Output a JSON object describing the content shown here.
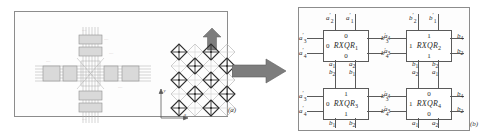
{
  "figure": {
    "panels": [
      {
        "id": "a",
        "caption": "(a)",
        "description": "crossbar-array-schematic-with-lattice"
      },
      {
        "id": "b",
        "caption": "(b)",
        "description": "rxqr-gate-block-diagram"
      }
    ],
    "axis": {
      "x_label": "x",
      "y_label": "y"
    },
    "arrows": [
      {
        "name": "up-arrow",
        "direction": "up"
      },
      {
        "name": "right-arrow",
        "direction": "right"
      }
    ]
  },
  "gates": [
    {
      "name": "RXQR",
      "index": "1",
      "label_prefix": "RXQR",
      "top_value": "0",
      "bottom_value": "0",
      "left_value": "0",
      "right_value": "",
      "top_ports": [
        {
          "base": "a",
          "sub": "2",
          "prime": true
        },
        {
          "base": "a",
          "sub": "1",
          "prime": true
        }
      ],
      "left_ports": [
        {
          "base": "a",
          "sub": "3",
          "prime": true
        },
        {
          "base": "a",
          "sub": "4",
          "prime": true
        }
      ],
      "right_ports": [
        {
          "base": "a",
          "sub": "4",
          "prime": false
        },
        {
          "base": "a",
          "sub": "3",
          "prime": false
        }
      ],
      "bottom_ports": [
        {
          "base": "a",
          "sub": "1",
          "prime": false
        },
        {
          "base": "a",
          "sub": "2",
          "prime": false
        }
      ]
    },
    {
      "name": "RXQR",
      "index": "2",
      "label_prefix": "RXQR",
      "top_value": "1",
      "bottom_value": "1",
      "left_value": "1",
      "right_value": "",
      "top_ports": [
        {
          "base": "b",
          "sub": "2",
          "prime": true
        },
        {
          "base": "b",
          "sub": "1",
          "prime": true
        }
      ],
      "left_ports": [
        {
          "base": "b",
          "sub": "3",
          "prime": true
        },
        {
          "base": "b",
          "sub": "4",
          "prime": true
        }
      ],
      "right_ports": [
        {
          "base": "b",
          "sub": "4",
          "prime": false
        },
        {
          "base": "b",
          "sub": "2",
          "prime": false
        }
      ],
      "bottom_ports": [
        {
          "base": "b",
          "sub": "1",
          "prime": false
        },
        {
          "base": "b",
          "sub": "2",
          "prime": false
        }
      ]
    },
    {
      "name": "RXQR",
      "index": "3",
      "label_prefix": "RXQR",
      "top_value": "1",
      "bottom_value": "1",
      "left_value": "0",
      "right_value": "",
      "top_ports": [
        {
          "base": "b",
          "sub": "2",
          "prime": false
        },
        {
          "base": "b",
          "sub": "1",
          "prime": false
        }
      ],
      "left_ports": [
        {
          "base": "a",
          "sub": "3",
          "prime": true
        },
        {
          "base": "a",
          "sub": "4",
          "prime": true
        }
      ],
      "right_ports": [
        {
          "base": "a",
          "sub": "4",
          "prime": false
        },
        {
          "base": "a",
          "sub": "3",
          "prime": false
        }
      ],
      "bottom_ports": [
        {
          "base": "b",
          "sub": "1",
          "prime": false
        },
        {
          "base": "b",
          "sub": "2",
          "prime": false
        }
      ]
    },
    {
      "name": "RXQR",
      "index": "4",
      "label_prefix": "RXQR",
      "top_value": "0",
      "bottom_value": "0",
      "left_value": "1",
      "right_value": "",
      "top_ports": [
        {
          "base": "a",
          "sub": "2",
          "prime": false
        },
        {
          "base": "a",
          "sub": "1",
          "prime": false
        }
      ],
      "left_ports": [
        {
          "base": "b",
          "sub": "3",
          "prime": true
        },
        {
          "base": "b",
          "sub": "4",
          "prime": true
        }
      ],
      "right_ports": [
        {
          "base": "b",
          "sub": "4",
          "prime": false
        },
        {
          "base": "b",
          "sub": "2",
          "prime": false
        }
      ],
      "bottom_ports": [
        {
          "base": "a",
          "sub": "1",
          "prime": false
        },
        {
          "base": "a",
          "sub": "2",
          "prime": false
        }
      ]
    }
  ],
  "colors": {
    "ink": "#2b2b2b",
    "line": "#5a5a5a",
    "panel_border": "#8c8c8c",
    "arrow_fill": "#7d7d7d",
    "lattice_dark": "#2f2f2f",
    "lattice_light": "#b9b9b9"
  }
}
